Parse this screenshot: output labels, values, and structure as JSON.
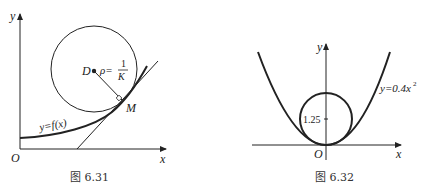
{
  "figure_31": {
    "caption": "图 6.31",
    "axis_y": "y",
    "axis_x": "x",
    "origin": "O",
    "center_label": "D",
    "rho_label": "ρ=",
    "rho_num": "1",
    "rho_den": "K",
    "point_label": "M",
    "curve_label": "y=f(x)"
  },
  "figure_32": {
    "caption": "图 6.32",
    "axis_y": "y",
    "axis_x": "x",
    "origin": "O",
    "tick_label": "1.25",
    "curve_label": "y=0.4x",
    "curve_exp": "2"
  }
}
